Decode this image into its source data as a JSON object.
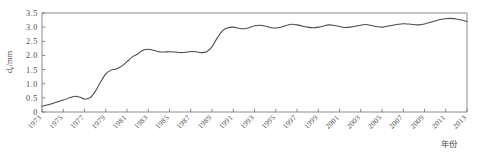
{
  "chart_data": {
    "type": "line",
    "title": "",
    "subtitle": "",
    "xlabel": "年份",
    "ylabel": "dₑ/mm",
    "ylabel_base": "d",
    "ylabel_sub": "e",
    "ylabel_unit": "/mm",
    "xlim": [
      1973,
      2013
    ],
    "ylim": [
      0,
      3.5
    ],
    "ytick_labels": [
      "3.5",
      "3.0",
      "2.5",
      "2.0",
      "1.5",
      "1.0",
      "0.5",
      "0"
    ],
    "ytick_values": [
      3.5,
      3.0,
      2.5,
      2.0,
      1.5,
      1.0,
      0.5,
      0
    ],
    "xtick_labels": [
      "1973",
      "1975",
      "1977",
      "1979",
      "1981",
      "1983",
      "1985",
      "1987",
      "1989",
      "1991",
      "1993",
      "1995",
      "1997",
      "1999",
      "2001",
      "2003",
      "2005",
      "2007",
      "2009",
      "2011",
      "2013"
    ],
    "xtick_values": [
      1973,
      1975,
      1977,
      1979,
      1981,
      1983,
      1985,
      1987,
      1989,
      1991,
      1993,
      1995,
      1997,
      1999,
      2001,
      2003,
      2005,
      2007,
      2009,
      2011,
      2013
    ],
    "grid": false,
    "legend": null,
    "line_color": "#4a4a4a",
    "axis_color": "#6f6f6f",
    "series": [
      {
        "name": "累积冲刷深度",
        "x": [
          1973,
          1974,
          1975,
          1976,
          1976.6,
          1977,
          1977.5,
          1978,
          1978.5,
          1979,
          1979.5,
          1980,
          1980.5,
          1981,
          1981.5,
          1982,
          1982.5,
          1983,
          1983.5,
          1984,
          1984.5,
          1985,
          1985.5,
          1986,
          1986.5,
          1987,
          1987.5,
          1988,
          1988.5,
          1989,
          1989.5,
          1990,
          1990.5,
          1991,
          1991.5,
          1992,
          1992.5,
          1993,
          1993.5,
          1994,
          1994.5,
          1995,
          1995.5,
          1996,
          1996.5,
          1997,
          1997.5,
          1998,
          1998.5,
          1999,
          1999.5,
          2000,
          2000.5,
          2001,
          2001.5,
          2002,
          2002.5,
          2003,
          2003.5,
          2004,
          2004.5,
          2005,
          2005.5,
          2006,
          2006.5,
          2007,
          2007.5,
          2008,
          2008.5,
          2009,
          2009.5,
          2010,
          2010.5,
          2011,
          2011.5,
          2012,
          2012.5,
          2013
        ],
        "y": [
          0.2,
          0.3,
          0.42,
          0.55,
          0.52,
          0.46,
          0.5,
          0.72,
          1.05,
          1.35,
          1.48,
          1.52,
          1.62,
          1.78,
          1.95,
          2.05,
          2.18,
          2.22,
          2.18,
          2.13,
          2.12,
          2.13,
          2.12,
          2.1,
          2.11,
          2.14,
          2.13,
          2.1,
          2.13,
          2.3,
          2.62,
          2.88,
          2.98,
          3.0,
          2.96,
          2.94,
          2.98,
          3.05,
          3.07,
          3.04,
          2.99,
          2.97,
          3.0,
          3.06,
          3.1,
          3.08,
          3.04,
          3.0,
          2.98,
          3.0,
          3.04,
          3.08,
          3.06,
          3.02,
          2.99,
          3.0,
          3.03,
          3.07,
          3.09,
          3.06,
          3.02,
          3.0,
          3.03,
          3.07,
          3.1,
          3.12,
          3.11,
          3.09,
          3.08,
          3.11,
          3.16,
          3.22,
          3.27,
          3.3,
          3.31,
          3.29,
          3.25,
          3.2
        ]
      }
    ],
    "plot_area": {
      "left": 42,
      "top": 13,
      "right": 467,
      "bottom": 112
    }
  }
}
